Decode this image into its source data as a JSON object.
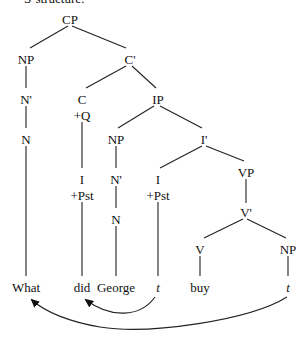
{
  "heading": "S-structure:",
  "tree": {
    "nodes": {
      "cp": "CP",
      "np_spec": "NP",
      "c_bar": "C'",
      "n_bar_1": "N'",
      "c": "C",
      "c_feature": "+Q",
      "ip": "IP",
      "n_1": "N",
      "np_subj": "NP",
      "i_bar": "I'",
      "i_moved": "I",
      "i_moved_feature": "+Pst",
      "n_bar_2": "N'",
      "i": "I",
      "i_feature": "+Pst",
      "vp": "VP",
      "n_2": "N",
      "v_bar": "V'",
      "v": "V",
      "np_obj": "NP"
    },
    "terminals": {
      "what": "What",
      "did": "did",
      "george": "George",
      "trace_i": "t",
      "buy": "buy",
      "trace_np": "t"
    }
  },
  "movement_arrows": [
    {
      "from": "trace_i",
      "to": "did",
      "label": "I-to-C movement"
    },
    {
      "from": "trace_np",
      "to": "what",
      "label": "wh-movement"
    }
  ]
}
